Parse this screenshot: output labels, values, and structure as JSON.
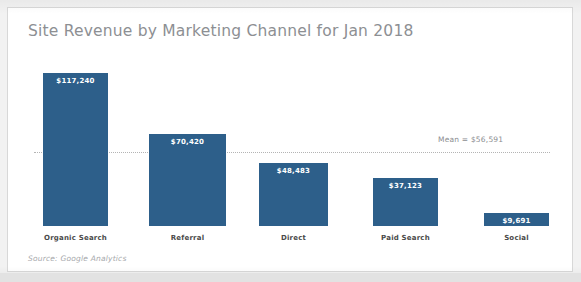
{
  "card": {
    "title": "Site Revenue by Marketing Channel for Jan 2018",
    "source_note": "Source: Google Analytics"
  },
  "chart_data": {
    "type": "bar",
    "title": "Site Revenue by Marketing Channel for Jan 2018",
    "xlabel": "",
    "ylabel": "",
    "ylim": [
      0,
      117240
    ],
    "grid": false,
    "legend": "none",
    "axis_visible": false,
    "categories": [
      "Organic Search",
      "Referral",
      "Direct",
      "Paid Search",
      "Social"
    ],
    "values": [
      117240,
      70420,
      48483,
      37123,
      9691
    ],
    "value_labels": [
      "$117,240",
      "$70,420",
      "$48,483",
      "$37,123",
      "$9,691"
    ],
    "bar_color": "#2d5f8a",
    "value_label_color": "#ffffff",
    "annotations": [
      {
        "type": "mean-line",
        "label": "Mean = $56,591",
        "value": 56591,
        "line_style": "dotted",
        "line_color": "#b4b4b4",
        "label_color": "#8b8d90"
      }
    ],
    "source": "Source: Google Analytics"
  },
  "theme": {
    "page_background": "#f2f2f2",
    "card_background": "#ffffff",
    "card_border": "#d8d8d8",
    "title_color": "#8d8f93",
    "category_label_color": "#4a4a4a",
    "source_color": "#a6a8ab"
  }
}
